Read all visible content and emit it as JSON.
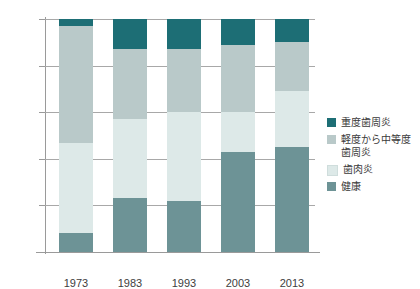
{
  "chart_data": {
    "type": "bar",
    "stacked": true,
    "stack_total": 100,
    "title": "",
    "subtitle": "",
    "xlabel": "",
    "ylabel": "",
    "categories": [
      "1973",
      "1983",
      "1993",
      "2003",
      "2013"
    ],
    "ytick_labels": [
      "0 %",
      "20 %",
      "40 %",
      "60 %",
      "80 %",
      "100 %"
    ],
    "ytick_values": [
      0,
      20,
      40,
      60,
      80,
      100
    ],
    "ylim": [
      0,
      100
    ],
    "grid": true,
    "legend_position": "right",
    "series": [
      {
        "name": "重度歯周炎",
        "color": "#1d6e75",
        "values": [
          3,
          13,
          13,
          11,
          10
        ]
      },
      {
        "name": "軽度から中等度\n歯周炎",
        "color": "#b9c9c9",
        "values": [
          50,
          30,
          27,
          29,
          21
        ]
      },
      {
        "name": "歯肉炎",
        "color": "#dde9e8",
        "values": [
          39,
          34,
          38,
          17,
          24
        ]
      },
      {
        "name": "健康",
        "color": "#6d9396",
        "values": [
          8,
          23,
          22,
          43,
          45
        ]
      }
    ]
  },
  "axis": {
    "y": {
      "ticks": [
        {
          "label": "100 %",
          "value": 100
        },
        {
          "label": "80 %",
          "value": 80
        },
        {
          "label": "60 %",
          "value": 60
        },
        {
          "label": "40 %",
          "value": 40
        },
        {
          "label": "20 %",
          "value": 20
        },
        {
          "label": "0 %",
          "value": 0
        }
      ]
    },
    "x": {
      "ticks": [
        "1973",
        "1983",
        "1993",
        "2003",
        "2013"
      ]
    }
  },
  "legend": {
    "items": [
      {
        "label": "重度歯周炎",
        "color": "#1d6e75"
      },
      {
        "label": "軽度から中等度\n歯周炎",
        "color": "#b9c9c9"
      },
      {
        "label": "歯肉炎",
        "color": "#dde9e8",
        "swatch_border": "#cfdddc"
      },
      {
        "label": "健康",
        "color": "#6d9396"
      }
    ]
  },
  "colors": {
    "axis": "#9a9a9a",
    "grid": "#a8a8a8",
    "text": "#3d3d3d",
    "background": "#ffffff"
  }
}
